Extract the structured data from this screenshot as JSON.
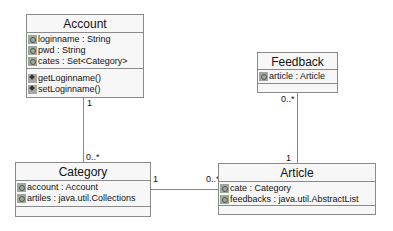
{
  "diagram": {
    "type": "UML class diagram",
    "classes": {
      "account": {
        "name": "Account",
        "attributes": [
          {
            "icon": "attribute-icon",
            "text": "loginname : String"
          },
          {
            "icon": "attribute-icon",
            "text": "pwd : String"
          },
          {
            "icon": "attribute-icon",
            "text": "cates : Set<Category>"
          }
        ],
        "operations": [
          {
            "icon": "operation-icon",
            "text": "getLoginname()"
          },
          {
            "icon": "operation-icon",
            "text": "setLoginname()"
          }
        ]
      },
      "feedback": {
        "name": "Feedback",
        "attributes": [
          {
            "icon": "attribute-icon",
            "text": "article : Article"
          }
        ],
        "operations": []
      },
      "category": {
        "name": "Category",
        "attributes": [
          {
            "icon": "attribute-icon",
            "text": "account : Account"
          },
          {
            "icon": "attribute-icon",
            "text": "artiles : java.util.Collections"
          }
        ],
        "operations": []
      },
      "article": {
        "name": "Article",
        "attributes": [
          {
            "icon": "attribute-icon",
            "text": "cate : Category"
          },
          {
            "icon": "attribute-icon",
            "text": "feedbacks : java.util.AbstractList"
          }
        ],
        "operations": []
      }
    },
    "associations": {
      "account_category": {
        "from": "Account",
        "to": "Category",
        "from_mult": "1",
        "to_mult": "0..*"
      },
      "category_article": {
        "from": "Category",
        "to": "Article",
        "from_mult": "1",
        "to_mult": "0..*"
      },
      "feedback_article": {
        "from": "Feedback",
        "to": "Article",
        "from_mult": "0..*",
        "to_mult": "1"
      }
    },
    "colors": {
      "box_fill": "#f7f7f7",
      "box_border": "#8a8a8a",
      "line": "#8a8a8a",
      "text": "#111111"
    }
  }
}
